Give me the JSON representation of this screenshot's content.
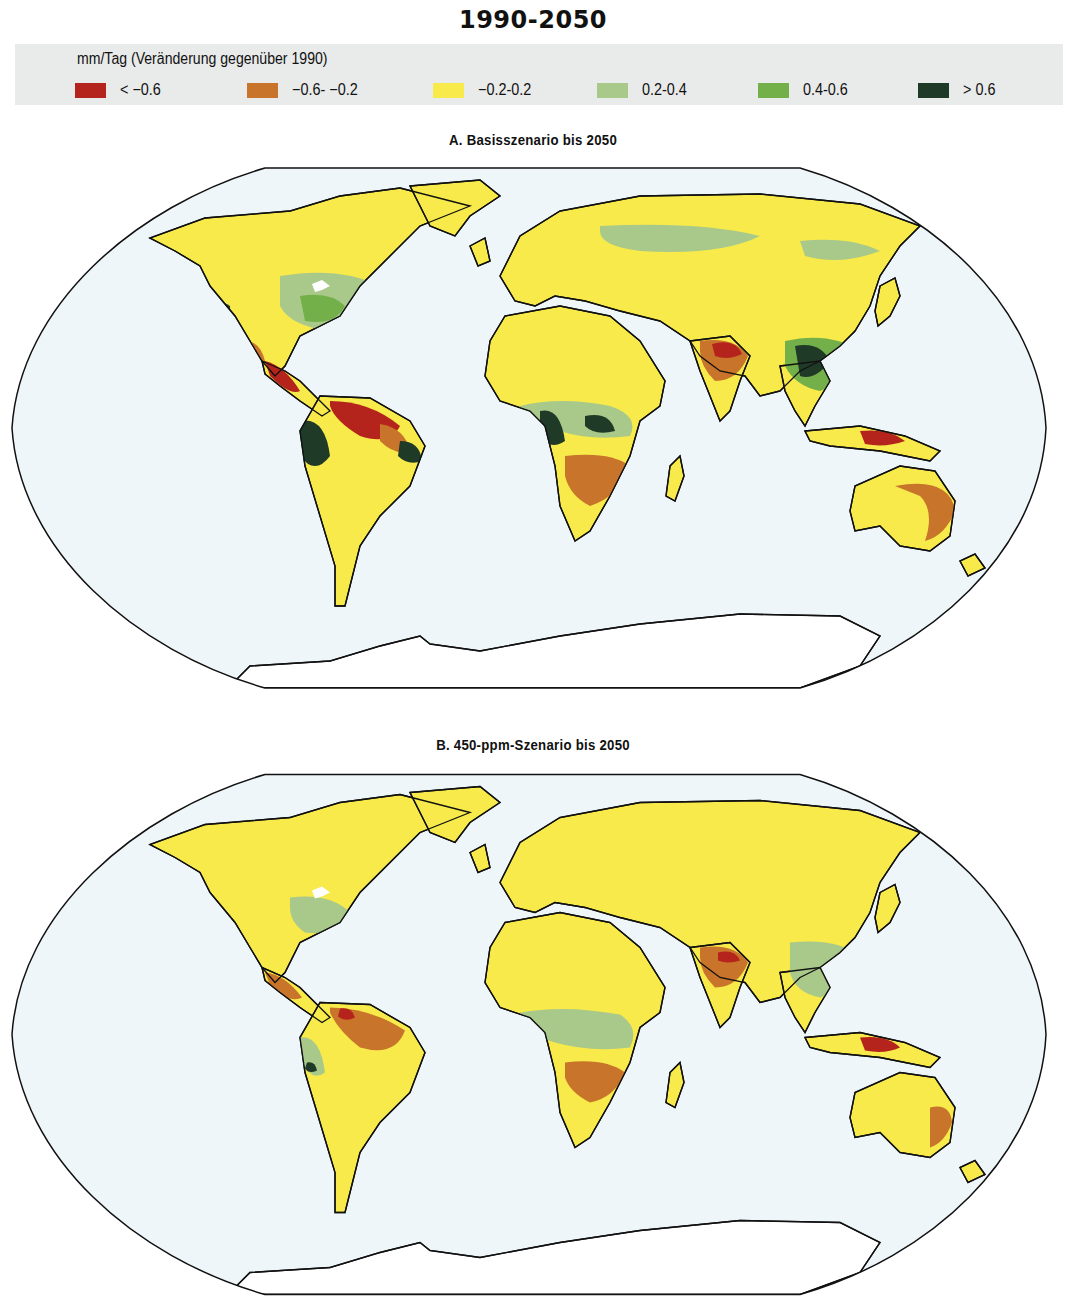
{
  "title": "1990-2050",
  "legend": {
    "title": "mm/Tag (Veränderung gegenüber 1990)",
    "items": [
      {
        "label": "< −0.6",
        "color": "#b5241c"
      },
      {
        "label": "−0.6- −0.2",
        "color": "#c8742a"
      },
      {
        "label": "−0.2-0.2",
        "color": "#f7ea4a"
      },
      {
        "label": "0.2-0.4",
        "color": "#a9c98a"
      },
      {
        "label": "0.4-0.6",
        "color": "#74b04a"
      },
      {
        "label": "> 0.6",
        "color": "#1f3a26"
      }
    ]
  },
  "colors": {
    "ocean": "#eef6fa",
    "outline": "#111111",
    "antarctica": "#ffffff",
    "legend_bg": "#e9eaea"
  },
  "panels": [
    {
      "id": "A",
      "title": "A. Basisszenario bis 2050"
    },
    {
      "id": "B",
      "title": "B. 450-ppm-Szenario bis 2050"
    }
  ],
  "chart_data": {
    "type": "heatmap",
    "title": "1990-2050",
    "unit": "mm/Tag (Veränderung gegenüber 1990)",
    "projection": "Robinson (world)",
    "classes": [
      {
        "range": "< -0.6",
        "color": "#b5241c"
      },
      {
        "range": "-0.6 - -0.2",
        "color": "#c8742a"
      },
      {
        "range": "-0.2 - 0.2",
        "color": "#f7ea4a"
      },
      {
        "range": "0.2 - 0.4",
        "color": "#a9c98a"
      },
      {
        "range": "0.4 - 0.6",
        "color": "#74b04a"
      },
      {
        "range": "> 0.6",
        "color": "#1f3a26"
      }
    ],
    "maps": [
      {
        "title": "A. Basisszenario bis 2050",
        "regions": [
          {
            "region": "Northern Amazon / Venezuela",
            "class": "< -0.6"
          },
          {
            "region": "Central America",
            "class": "< -0.6"
          },
          {
            "region": "Northern India",
            "class": "< -0.6"
          },
          {
            "region": "Southern Africa",
            "class": "-0.6 - -0.2"
          },
          {
            "region": "Mexico",
            "class": "-0.6 - -0.2"
          },
          {
            "region": "Eastern Australia",
            "class": "-0.6 - -0.2"
          },
          {
            "region": "Madagascar",
            "class": "-0.6 - -0.2"
          },
          {
            "region": "Central Africa / Congo",
            "class": "> 0.6"
          },
          {
            "region": "Southern China / Indochina",
            "class": "> 0.6"
          },
          {
            "region": "Western Amazon / Andes",
            "class": "> 0.6"
          },
          {
            "region": "US West Coast",
            "class": "> 0.6"
          },
          {
            "region": "Eastern USA",
            "class": "0.2 - 0.4"
          },
          {
            "region": "Sahara / Siberia",
            "class": "-0.2 - 0.2"
          }
        ]
      },
      {
        "title": "B. 450-ppm-Szenario bis 2050",
        "regions": [
          {
            "region": "Northern India",
            "class": "< -0.6"
          },
          {
            "region": "Central America",
            "class": "< -0.6"
          },
          {
            "region": "Northern Amazon",
            "class": "-0.6 - -0.2"
          },
          {
            "region": "Southern Africa",
            "class": "-0.6 - -0.2"
          },
          {
            "region": "Southern China",
            "class": "0.2 - 0.4"
          },
          {
            "region": "Central Africa",
            "class": "0.2 - 0.4"
          },
          {
            "region": "Western Amazon",
            "class": "> 0.6"
          },
          {
            "region": "Eastern USA",
            "class": "0.2 - 0.4"
          },
          {
            "region": "Sahara / Siberia",
            "class": "-0.2 - 0.2"
          }
        ]
      }
    ]
  }
}
